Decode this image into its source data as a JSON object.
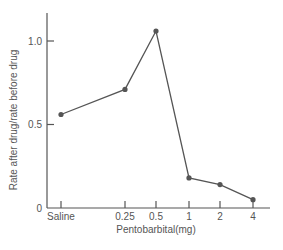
{
  "chart_data": {
    "type": "line",
    "title": "",
    "xlabel": "Pentobarbital(mg)",
    "ylabel": "Rate after drug/rate before drug",
    "categories": [
      "Saline",
      "0.25",
      "0.5",
      "1",
      "2",
      "4"
    ],
    "series": [
      {
        "name": "Rate ratio",
        "values": [
          0.56,
          0.71,
          1.06,
          0.18,
          0.14,
          0.05
        ]
      }
    ],
    "ylim": [
      0,
      1.2
    ],
    "yticks": [
      0,
      0.5,
      1.0
    ],
    "ytick_labels": [
      "0",
      "0.5",
      "1.0"
    ],
    "grid": false,
    "legend": null
  },
  "style": {
    "line_color": "#555555",
    "axis_color": "#555555",
    "text_color": "#555555"
  }
}
